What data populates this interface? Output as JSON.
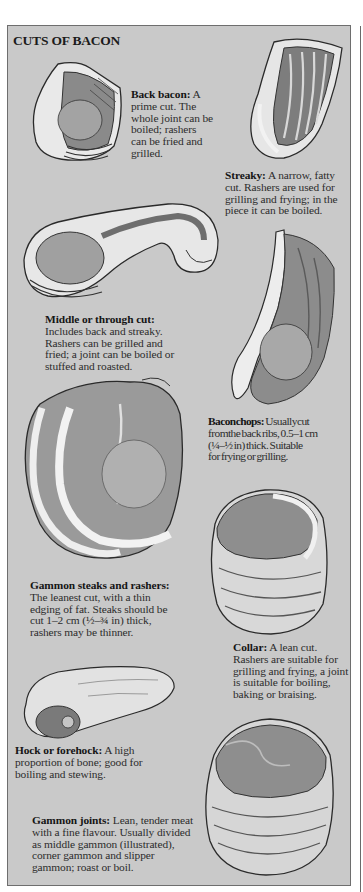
{
  "page": {
    "title": "CUTS OF BACON",
    "background_color": "#c9c9c9",
    "border_color": "#6e6e6e",
    "text_color": "#2c2c2c"
  },
  "cuts": [
    {
      "name": "Back bacon:",
      "lines": [
        "A",
        "prime cut. The",
        "whole joint can be",
        "boiled; rashers",
        "can be fried and",
        "grilled."
      ],
      "illustration": "back-bacon-illustration"
    },
    {
      "name": "Streaky:",
      "lines": [
        "A narrow, fatty",
        "cut. Rashers are used for",
        "grilling and frying; in the",
        "piece it can be boiled."
      ],
      "illustration": "streaky-illustration"
    },
    {
      "name": "Middle or through cut:",
      "lines": [
        "Includes back and streaky.",
        "Rashers can be grilled and",
        "fried; a joint can be boiled or",
        "stuffed and roasted."
      ],
      "illustration": "middle-cut-illustration"
    },
    {
      "name": "Baconchops:",
      "lines": [
        "Usuallycut",
        "fromthe back ribs, 0.5–1 cm",
        "(¼–½ in) thick. Suitable",
        "for frying or grilling."
      ],
      "illustration": "bacon-chops-illustration"
    },
    {
      "name": "Gammon steaks and rashers:",
      "lines": [
        "The leanest cut, with a thin",
        "edging of fat. Steaks should be",
        "cut 1–2 cm (½–¾ in) thick,",
        "rashers may be thinner."
      ],
      "illustration": "gammon-steaks-illustration"
    },
    {
      "name": "Collar:",
      "lines": [
        "A lean cut.",
        "Rashers are suitable for",
        "grilling and frying, a joint",
        "is suitable for boiling,",
        "baking or braising."
      ],
      "illustration": "collar-illustration"
    },
    {
      "name": "Hock or forehock:",
      "lines": [
        "A high",
        "proportion of bone; good for",
        "boiling and stewing."
      ],
      "illustration": "hock-illustration"
    },
    {
      "name": "Gammon joints:",
      "lines": [
        "Lean, tender meat",
        "with a fine flavour. Usually divided",
        "as middle gammon (illustrated),",
        "corner gammon and slipper",
        "gammon; roast or boil."
      ],
      "illustration": "gammon-joint-illustration"
    }
  ]
}
